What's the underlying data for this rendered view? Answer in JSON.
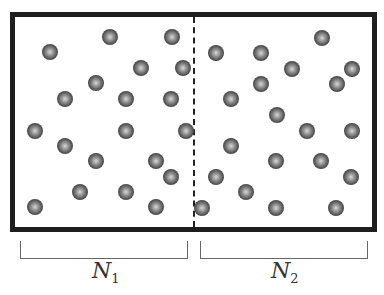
{
  "figure": {
    "left_label": {
      "symbol": "N",
      "subscript": "1"
    },
    "right_label": {
      "symbol": "N",
      "subscript": "2"
    },
    "colors": {
      "border": "#1e1e1e",
      "ball_dark": "#1a1a1a",
      "ball_light": "#d8d8d8",
      "bracket": "#666666"
    }
  },
  "balls_left": [
    [
      110,
      37
    ],
    [
      172,
      37
    ],
    [
      50,
      52
    ],
    [
      141,
      68
    ],
    [
      183,
      68
    ],
    [
      96,
      83
    ],
    [
      65,
      99
    ],
    [
      126,
      99
    ],
    [
      171,
      99
    ],
    [
      35,
      131
    ],
    [
      126,
      131
    ],
    [
      186,
      131
    ],
    [
      65,
      146
    ],
    [
      96,
      161
    ],
    [
      156,
      161
    ],
    [
      171,
      177
    ],
    [
      80,
      192
    ],
    [
      126,
      192
    ],
    [
      35,
      207
    ],
    [
      156,
      207
    ]
  ],
  "balls_right": [
    [
      322,
      38
    ],
    [
      216,
      53
    ],
    [
      261,
      53
    ],
    [
      292,
      69
    ],
    [
      352,
      69
    ],
    [
      261,
      84
    ],
    [
      337,
      84
    ],
    [
      231,
      99
    ],
    [
      277,
      115
    ],
    [
      307,
      131
    ],
    [
      352,
      131
    ],
    [
      231,
      146
    ],
    [
      276,
      161
    ],
    [
      321,
      161
    ],
    [
      216,
      177
    ],
    [
      351,
      177
    ],
    [
      246,
      192
    ],
    [
      202,
      208
    ],
    [
      276,
      208
    ],
    [
      336,
      208
    ]
  ]
}
